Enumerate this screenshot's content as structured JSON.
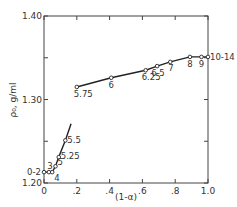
{
  "chart_data": {
    "type": "line",
    "title": "",
    "xlabel": "(1-α)",
    "ylabel": "ρ₀, g/ml",
    "xlim": [
      0,
      1.0
    ],
    "ylim": [
      1.2,
      1.4
    ],
    "grid": false,
    "legend": null,
    "x_ticks": [
      "0",
      ".2",
      ".4",
      ".6",
      ".8",
      "1.0"
    ],
    "y_ticks": [
      "1.20",
      "1.30",
      "1.40"
    ],
    "y_minor_ticks": [
      1.25,
      1.35
    ],
    "series": [
      {
        "name": "low-segment",
        "points": [
          {
            "x": 0.0,
            "y": 1.213,
            "label": "0-2"
          },
          {
            "x": 0.03,
            "y": 1.213,
            "label": "3"
          },
          {
            "x": 0.05,
            "y": 1.213,
            "label": "4"
          },
          {
            "x": 0.07,
            "y": 1.22,
            "label": "5"
          },
          {
            "x": 0.09,
            "y": 1.231,
            "label": "5.25"
          },
          {
            "x": 0.13,
            "y": 1.251,
            "label": "5.5"
          }
        ],
        "line_extends_to": {
          "x": 0.165,
          "y": 1.271
        }
      },
      {
        "name": "high-segment",
        "points": [
          {
            "x": 0.2,
            "y": 1.315,
            "label": "5.75"
          },
          {
            "x": 0.41,
            "y": 1.326,
            "label": "6"
          },
          {
            "x": 0.62,
            "y": 1.335,
            "label": "6.25"
          },
          {
            "x": 0.69,
            "y": 1.34,
            "label": "6.5"
          },
          {
            "x": 0.77,
            "y": 1.345,
            "label": "7"
          },
          {
            "x": 0.89,
            "y": 1.351,
            "label": "8"
          },
          {
            "x": 0.96,
            "y": 1.351,
            "label": "9"
          },
          {
            "x": 1.0,
            "y": 1.351,
            "label": "10-14"
          }
        ]
      }
    ]
  }
}
